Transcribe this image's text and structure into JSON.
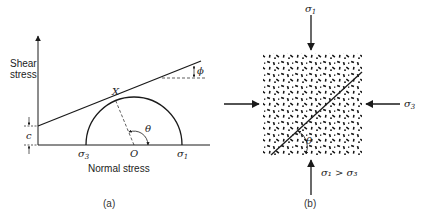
{
  "panel_a": {
    "caption": "(a)",
    "y_axis_label_line1": "Shear",
    "y_axis_label_line2": "stress",
    "x_axis_label": "Normal stress",
    "point_x": "X",
    "center_o": "O",
    "sigma3": "σ",
    "sigma3_sub": "3",
    "sigma1": "σ",
    "sigma1_sub": "1",
    "theta": "θ",
    "phi": "ϕ",
    "cohesion": "c"
  },
  "panel_b": {
    "caption": "(b)",
    "sigma1_top": "σ",
    "sigma1_top_sub": "1",
    "sigma3_right": "σ",
    "sigma3_right_sub": "3",
    "theta": "θ",
    "condition": "σ₁ > σ₃"
  },
  "colors": {
    "ink": "#1a1a1a",
    "background": "#ffffff"
  }
}
